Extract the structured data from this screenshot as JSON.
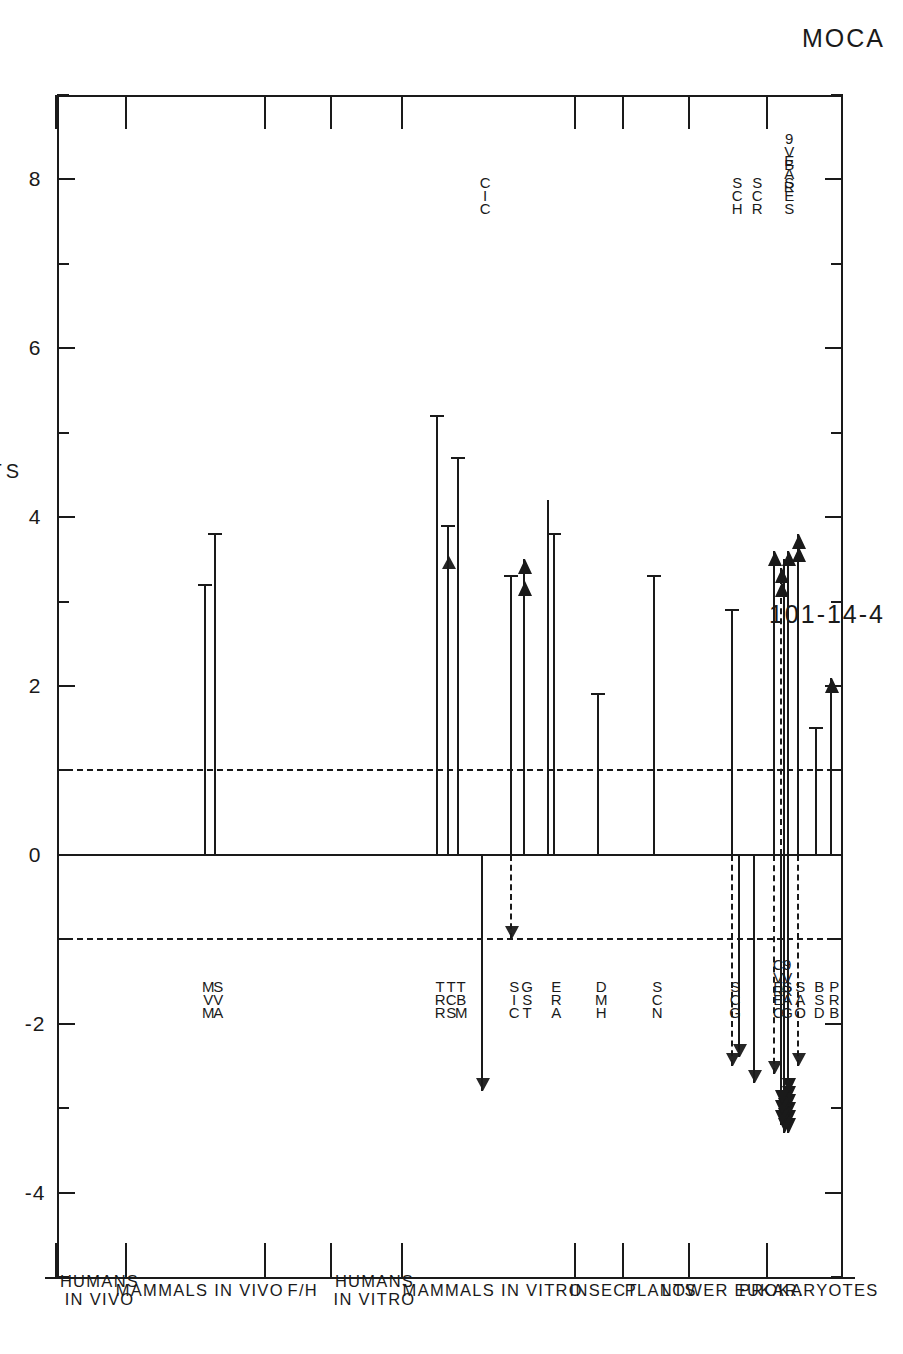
{
  "chemical": {
    "name": "MOCA",
    "cas_number": "101-14-4"
  },
  "axis": {
    "title": "LOG DOSE UNITS",
    "ticks": [
      8,
      6,
      4,
      2,
      0,
      -2,
      -4
    ],
    "tick_labels": [
      "8",
      "6",
      "4",
      "2",
      "0",
      "-2",
      "-4"
    ],
    "min": 9,
    "max": -5,
    "reference_lines": [
      1,
      0,
      -1
    ]
  },
  "categories": [
    {
      "label": "PROKARYOTES"
    },
    {
      "label": "LOWER EUKAR."
    },
    {
      "label": "PLANTS"
    },
    {
      "label": "INSECT"
    },
    {
      "label": "MAMMALS IN VITRO"
    },
    {
      "label": "HUMANS\nIN VITRO"
    },
    {
      "label": "F/H"
    },
    {
      "label": "MAMMALS IN VIVO"
    },
    {
      "label": "HUMANS\nIN VIVO"
    }
  ],
  "chart_data": {
    "type": "bar",
    "title": "MOCA",
    "subtitle": "101-14-4",
    "xlabel": "LOG DOSE UNITS",
    "ylabel": "",
    "orientation": "horizontal-bidirectional",
    "xlim": [
      9,
      -5
    ],
    "grid": false,
    "categories": [
      "PROKARYOTES",
      "LOWER EUKAR.",
      "PLANTS",
      "INSECT",
      "MAMMALS IN VITRO",
      "HUMANS IN VITRO",
      "F/H",
      "MAMMALS IN VIVO",
      "HUMANS IN VIVO"
    ],
    "bars": [
      {
        "code": "BPR",
        "group": "PROKARYOTES",
        "value": 2.1,
        "end": "arrow"
      },
      {
        "code": "DSB",
        "group": "PROKARYOTES",
        "value": 1.5,
        "end": "cap"
      },
      {
        "code": "OAS",
        "group": "PROKARYOTES",
        "value": 3.8,
        "end": "arrow"
      },
      {
        "code": "OAS",
        "group": "PROKARYOTES",
        "value": -2.5,
        "end": "arrow",
        "style": "dashed"
      },
      {
        "code": "G9V",
        "group": "PROKARYOTES",
        "value": 3.6,
        "end": "arrow"
      },
      {
        "code": "G9V",
        "group": "PROKARYOTES",
        "value": -3.3,
        "end": "arrow",
        "style": "dashed"
      },
      {
        "code": "ECC",
        "group": "PROKARYOTES",
        "value": 3.4,
        "end": "arrow"
      },
      {
        "code": "ECC",
        "group": "PROKARYOTES",
        "value": -3.3,
        "end": "arrow"
      },
      {
        "code": "ESE",
        "group": "PROKARYOTES",
        "value": 3.6,
        "end": "arrow"
      },
      {
        "code": "ESE",
        "group": "PROKARYOTES",
        "value": -2.6,
        "end": "arrow",
        "style": "dashed"
      },
      {
        "code": "SCG",
        "group": "LOWER EUKAR.",
        "value": 2.9,
        "end": "cap"
      },
      {
        "code": "SCH",
        "group": "LOWER EUKAR.",
        "value": -2.5,
        "end": "arrow"
      },
      {
        "code": "SCH",
        "group": "LOWER EUKAR.",
        "value": -2.4,
        "end": "arrow",
        "style": "dashed"
      },
      {
        "code": "SCR",
        "group": "LOWER EUKAR.",
        "value": -2.7,
        "end": "arrow"
      },
      {
        "code": "MCS",
        "group": "PLANTS",
        "value": 3.3,
        "end": "cap"
      },
      {
        "code": "DMH",
        "group": "INSECT",
        "value": 1.9,
        "end": "cap"
      },
      {
        "code": "EAR",
        "group": "MAMMALS IN VITRO",
        "value": 3.8,
        "end": "cap"
      },
      {
        "code": "ERA",
        "group": "MAMMALS IN VITRO",
        "value": 4.2,
        "end": "plain"
      },
      {
        "code": "GST",
        "group": "MAMMALS IN VITRO",
        "value": 3.5,
        "end": "arrow"
      },
      {
        "code": "SIC",
        "group": "MAMMALS IN VITRO",
        "value": 3.3,
        "end": "cap"
      },
      {
        "code": "SIC",
        "group": "MAMMALS IN VITRO",
        "value": -1.0,
        "end": "arrow",
        "style": "dashed"
      },
      {
        "code": "CIC",
        "group": "MAMMALS IN VITRO",
        "value": -2.8,
        "end": "arrow"
      },
      {
        "code": "TMR",
        "group": "MAMMALS IN VITRO",
        "value": 4.7,
        "end": "cap"
      },
      {
        "code": "TSC",
        "group": "MAMMALS IN VITRO",
        "value": 3.9,
        "end": "arrow"
      },
      {
        "code": "TBR",
        "group": "MAMMALS IN VITRO",
        "value": 5.2,
        "end": "cap"
      },
      {
        "code": "MVA",
        "group": "MAMMALS IN VIVO",
        "value": 3.8,
        "end": "cap"
      },
      {
        "code": "SVM",
        "group": "MAMMALS IN VIVO",
        "value": 3.2,
        "end": "cap"
      }
    ]
  },
  "code_labels_left": [
    {
      "text": "P\nR\nB"
    },
    {
      "text": "B\nS\nD"
    },
    {
      "text": "S\nA\nO"
    },
    {
      "text": "S\nA\nG",
      "text2": "9\nV\nR"
    },
    {
      "text": "E\nE\nC",
      "text2": "C\nV\nR"
    },
    {
      "text": "S\nC\nG"
    },
    {
      "text": "S\nC\nN"
    },
    {
      "text": "D\nM\nH"
    },
    {
      "text": "E\nR\nA"
    },
    {
      "text": "G\nS\nT"
    },
    {
      "text": "S\nI\nC"
    },
    {
      "text": "T\nB\nM"
    },
    {
      "text": "T\nC\nS"
    },
    {
      "text": "T\nR\nR"
    },
    {
      "text": "S\nV\nA"
    },
    {
      "text": "M\nV\nM"
    }
  ],
  "code_labels_right": [
    {
      "text": "S\nC\nR"
    },
    {
      "text": "S\nC\nH"
    },
    {
      "text": "C\nI\nC"
    },
    {
      "text": "S\nE\nS"
    },
    {
      "text": "E\nA\nR"
    },
    {
      "text": "9\nV\nB"
    }
  ]
}
